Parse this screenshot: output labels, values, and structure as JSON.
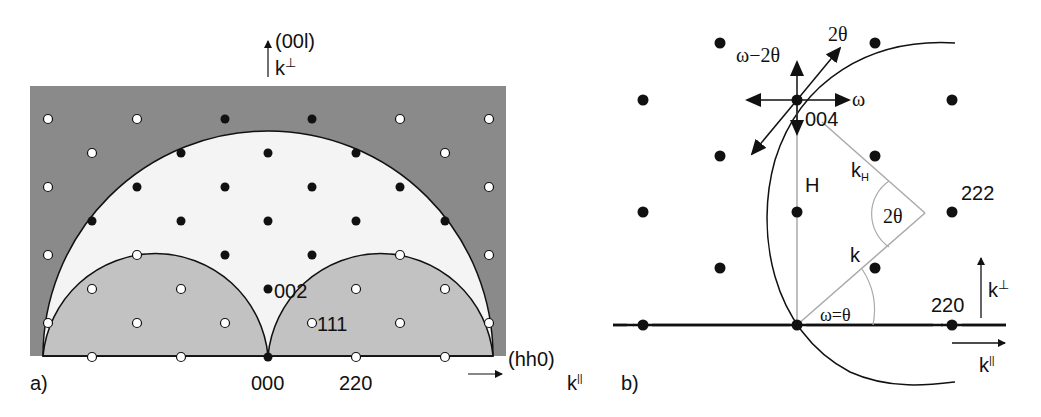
{
  "panel_a": {
    "label": "a)",
    "axis_vertical": {
      "index": "(00l)",
      "k": "k",
      "sup": "⊥"
    },
    "axis_horizontal": {
      "index": "(hh0)",
      "k": "k",
      "sup": "||"
    },
    "point_labels": {
      "origin": "000",
      "p220": "220",
      "p002": "002",
      "p111": "111"
    },
    "colors": {
      "forbidden_outer": "#8a8a8a",
      "accessible": "#f4f4f4",
      "forbidden_inner": "#c2c2c2",
      "stroke": "#111111"
    }
  },
  "panel_b": {
    "label": "b)",
    "point_labels": {
      "p004": "004",
      "p222": "222",
      "p220": "220"
    },
    "scan_labels": {
      "omega_2theta": "ω−2θ",
      "two_theta": "2θ",
      "omega": "ω"
    },
    "vector_labels": {
      "H": "H",
      "kH": "k",
      "kH_sub": "H",
      "k": "k",
      "angle_2theta": "2θ",
      "omega_eq_theta": "ω=θ"
    },
    "axis_vertical": {
      "k": "k",
      "sup": "⊥"
    },
    "axis_horizontal": {
      "k": "k",
      "sup": "||"
    }
  }
}
